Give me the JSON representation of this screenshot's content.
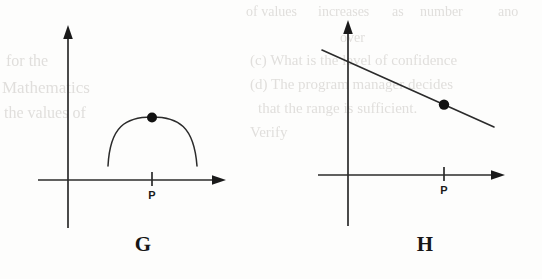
{
  "page": {
    "width": 542,
    "height": 279,
    "background_color": "#fdfdfc",
    "ink_color": "#1a1a1a",
    "ghost_color": "#c9c6c2"
  },
  "figures": [
    {
      "id": "G",
      "label": "G",
      "curve_type": "arc",
      "curve_description": "downward-opening circular arc above the x-axis with apex point marked",
      "point_label": "",
      "axis_tick_label": "P",
      "point": {
        "x": 152,
        "y": 118
      },
      "tick": {
        "x": 152
      },
      "x_axis": {
        "y": 180,
        "x_start": 38,
        "x_end": 225
      },
      "y_axis": {
        "x": 68,
        "y_top": 27,
        "y_bottom": 228
      },
      "arc": {
        "x_start": 108,
        "y_start": 165,
        "x_end": 197,
        "y_end": 165,
        "apex_x": 152,
        "apex_y": 117
      }
    },
    {
      "id": "H",
      "label": "H",
      "curve_type": "line",
      "curve_description": "straight line with negative slope crossing the y-axis, with a point marked on it",
      "point_label": "",
      "axis_tick_label": "P",
      "point": {
        "x": 444,
        "y": 102
      },
      "tick": {
        "x": 444
      },
      "x_axis": {
        "y": 175,
        "x_start": 318,
        "x_end": 505
      },
      "y_axis": {
        "x": 348,
        "y_top": 22,
        "y_bottom": 226
      },
      "line": {
        "x_start": 322,
        "y_start": 50,
        "x_end": 494,
        "y_end": 127
      }
    }
  ],
  "ghost_text": [
    {
      "text": "of values",
      "x": 246,
      "y": 12
    },
    {
      "text": "increases",
      "x": 300,
      "y": 12
    },
    {
      "text": "as",
      "x": 372,
      "y": 12
    },
    {
      "text": "number",
      "x": 404,
      "y": 12
    },
    {
      "text": "ano",
      "x": 495,
      "y": 12
    },
    {
      "text": "over",
      "x": 336,
      "y": 36
    },
    {
      "text": "(c) What is the level of confidence",
      "x": 254,
      "y": 58
    },
    {
      "text": "(d) The program manager decides",
      "x": 254,
      "y": 80
    },
    {
      "text": "that the range is sufficient.",
      "x": 262,
      "y": 102
    },
    {
      "text": "Verify",
      "x": 254,
      "y": 124
    },
    {
      "text": "for the",
      "x": 16,
      "y": 58
    },
    {
      "text": "Mathematics",
      "x": 10,
      "y": 84
    },
    {
      "text": "the values of",
      "x": 12,
      "y": 110
    }
  ]
}
